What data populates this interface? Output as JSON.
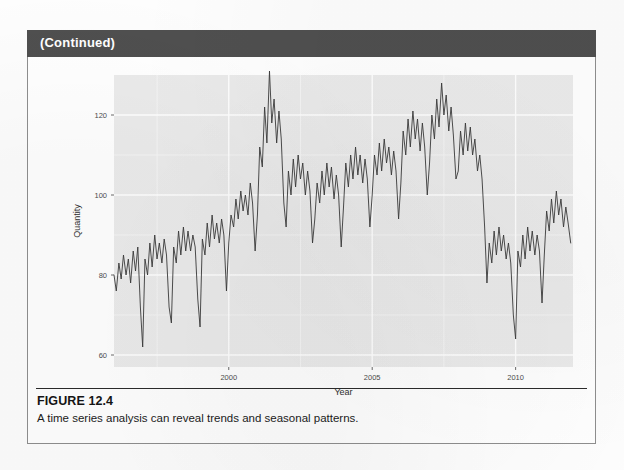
{
  "page": {
    "continued_label": "(Continued)"
  },
  "figure": {
    "number_label": "FIGURE 12.4",
    "caption": "A time series analysis can reveal trends and seasonal patterns."
  },
  "colors": {
    "header_bar": "#4f4f4f",
    "header_text": "#ffffff",
    "box_border": "#8e8e8e",
    "panel_background": "#ebebeb",
    "gridline_major": "#ffffff",
    "gridline_minor": "#f5f5f5",
    "series_line": "#3a3a3a",
    "axis_text": "#4d4d4d",
    "caption_text": "#1b1b1b"
  },
  "chart_data": {
    "type": "line",
    "title": "",
    "subtitle": "",
    "xlabel": "Year",
    "ylabel": "Quantity",
    "grid": true,
    "legend": "none",
    "xlim": [
      1996.0,
      2012.0
    ],
    "ylim": [
      57,
      130
    ],
    "xticks": [
      2000,
      2005,
      2010
    ],
    "xtick_labels": [
      "2000",
      "2005",
      "2010"
    ],
    "yticks": [
      60,
      80,
      100,
      120
    ],
    "ytick_labels": [
      "60",
      "80",
      "100",
      "120"
    ],
    "x_minor_ticks": [
      1997.5,
      2002.5,
      2007.5
    ],
    "y_minor_ticks": [
      70,
      90,
      110
    ],
    "series": [
      {
        "name": "Quantity",
        "x": [
          1996.0,
          1996.08,
          1996.17,
          1996.25,
          1996.33,
          1996.42,
          1996.5,
          1996.58,
          1996.67,
          1996.75,
          1996.83,
          1996.92,
          1997.0,
          1997.08,
          1997.17,
          1997.25,
          1997.33,
          1997.42,
          1997.5,
          1997.58,
          1997.67,
          1997.75,
          1997.83,
          1997.92,
          1998.0,
          1998.08,
          1998.17,
          1998.25,
          1998.33,
          1998.42,
          1998.5,
          1998.58,
          1998.67,
          1998.75,
          1998.83,
          1998.92,
          1999.0,
          1999.08,
          1999.17,
          1999.25,
          1999.33,
          1999.42,
          1999.5,
          1999.58,
          1999.67,
          1999.75,
          1999.83,
          1999.92,
          2000.0,
          2000.08,
          2000.17,
          2000.25,
          2000.33,
          2000.42,
          2000.5,
          2000.58,
          2000.67,
          2000.75,
          2000.83,
          2000.92,
          2001.0,
          2001.08,
          2001.17,
          2001.25,
          2001.33,
          2001.42,
          2001.5,
          2001.58,
          2001.67,
          2001.75,
          2001.83,
          2001.92,
          2002.0,
          2002.08,
          2002.17,
          2002.25,
          2002.33,
          2002.42,
          2002.5,
          2002.58,
          2002.67,
          2002.75,
          2002.83,
          2002.92,
          2003.0,
          2003.08,
          2003.17,
          2003.25,
          2003.33,
          2003.42,
          2003.5,
          2003.58,
          2003.67,
          2003.75,
          2003.83,
          2003.92,
          2004.0,
          2004.08,
          2004.17,
          2004.25,
          2004.33,
          2004.42,
          2004.5,
          2004.58,
          2004.67,
          2004.75,
          2004.83,
          2004.92,
          2005.0,
          2005.08,
          2005.17,
          2005.25,
          2005.33,
          2005.42,
          2005.5,
          2005.58,
          2005.67,
          2005.75,
          2005.83,
          2005.92,
          2006.0,
          2006.08,
          2006.17,
          2006.25,
          2006.33,
          2006.42,
          2006.5,
          2006.58,
          2006.67,
          2006.75,
          2006.83,
          2006.92,
          2007.0,
          2007.08,
          2007.17,
          2007.25,
          2007.33,
          2007.42,
          2007.5,
          2007.58,
          2007.67,
          2007.75,
          2007.83,
          2007.92,
          2008.0,
          2008.08,
          2008.17,
          2008.25,
          2008.33,
          2008.42,
          2008.5,
          2008.58,
          2008.67,
          2008.75,
          2008.83,
          2008.92,
          2009.0,
          2009.08,
          2009.17,
          2009.25,
          2009.33,
          2009.42,
          2009.5,
          2009.58,
          2009.67,
          2009.75,
          2009.83,
          2009.92,
          2010.0,
          2010.08,
          2010.17,
          2010.25,
          2010.33,
          2010.42,
          2010.5,
          2010.58,
          2010.67,
          2010.75,
          2010.83,
          2010.92,
          2011.0,
          2011.08,
          2011.17,
          2011.25,
          2011.33,
          2011.42,
          2011.5,
          2011.58,
          2011.67,
          2011.75,
          2011.83,
          2011.92
        ],
        "values": [
          80,
          76,
          83,
          79,
          85,
          80,
          84,
          78,
          86,
          81,
          87,
          72,
          62,
          84,
          80,
          88,
          82,
          90,
          84,
          88,
          83,
          89,
          85,
          72,
          68,
          87,
          83,
          91,
          85,
          92,
          86,
          91,
          86,
          90,
          87,
          74,
          67,
          89,
          85,
          93,
          87,
          95,
          89,
          93,
          88,
          94,
          90,
          76,
          88,
          95,
          92,
          99,
          94,
          101,
          96,
          100,
          95,
          103,
          98,
          86,
          95,
          112,
          107,
          122,
          113,
          131,
          118,
          124,
          113,
          121,
          114,
          98,
          92,
          106,
          100,
          109,
          102,
          110,
          104,
          108,
          100,
          106,
          101,
          88,
          94,
          103,
          98,
          106,
          100,
          108,
          102,
          107,
          99,
          105,
          100,
          87,
          97,
          108,
          102,
          110,
          104,
          112,
          105,
          110,
          103,
          109,
          104,
          92,
          100,
          110,
          105,
          113,
          106,
          114,
          108,
          112,
          105,
          111,
          106,
          94,
          103,
          116,
          110,
          119,
          112,
          121,
          114,
          119,
          111,
          118,
          112,
          100,
          108,
          120,
          114,
          124,
          117,
          128,
          120,
          125,
          116,
          122,
          115,
          104,
          106,
          116,
          110,
          118,
          111,
          117,
          110,
          114,
          106,
          110,
          104,
          92,
          78,
          88,
          83,
          91,
          85,
          92,
          86,
          90,
          84,
          88,
          83,
          70,
          64,
          86,
          82,
          90,
          84,
          92,
          86,
          91,
          85,
          90,
          86,
          73,
          85,
          96,
          91,
          99,
          93,
          101,
          95,
          99,
          92,
          97,
          93,
          88
        ]
      }
    ]
  }
}
